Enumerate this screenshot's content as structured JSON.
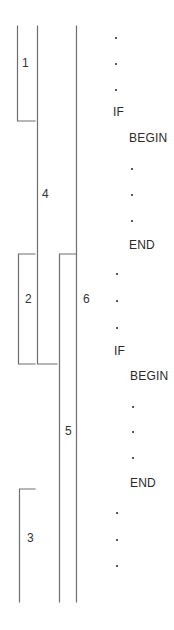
{
  "diagram": {
    "title": "",
    "segment_labels": [
      {
        "id": "1",
        "text": "1",
        "x": 22,
        "y": 57
      },
      {
        "id": "4",
        "text": "4",
        "x": 42,
        "y": 188
      },
      {
        "id": "2",
        "text": "2",
        "x": 25,
        "y": 293
      },
      {
        "id": "6",
        "text": "6",
        "x": 83,
        "y": 293
      },
      {
        "id": "5",
        "text": "5",
        "x": 65,
        "y": 425
      },
      {
        "id": "3",
        "text": "3",
        "x": 27,
        "y": 532
      }
    ],
    "code_lines": [
      {
        "type": "dot",
        "x": 115,
        "y": 37
      },
      {
        "type": "dot",
        "x": 115,
        "y": 63
      },
      {
        "type": "dot",
        "x": 115,
        "y": 89
      },
      {
        "type": "text",
        "text": "IF",
        "x": 113,
        "y": 106
      },
      {
        "type": "text",
        "text": "BEGIN",
        "x": 129,
        "y": 132
      },
      {
        "type": "dot",
        "x": 131,
        "y": 168
      },
      {
        "type": "dot",
        "x": 131,
        "y": 194
      },
      {
        "type": "dot",
        "x": 131,
        "y": 220
      },
      {
        "type": "text",
        "text": "END",
        "x": 129,
        "y": 239
      },
      {
        "type": "dot",
        "x": 116,
        "y": 273
      },
      {
        "type": "dot",
        "x": 116,
        "y": 300
      },
      {
        "type": "dot",
        "x": 116,
        "y": 327
      },
      {
        "type": "text",
        "text": "IF",
        "x": 114,
        "y": 345
      },
      {
        "type": "text",
        "text": "BEGIN",
        "x": 130,
        "y": 370
      },
      {
        "type": "dot",
        "x": 132,
        "y": 406
      },
      {
        "type": "dot",
        "x": 132,
        "y": 431
      },
      {
        "type": "dot",
        "x": 132,
        "y": 457
      },
      {
        "type": "text",
        "text": "END",
        "x": 130,
        "y": 477
      },
      {
        "type": "dot",
        "x": 116,
        "y": 512
      },
      {
        "type": "dot",
        "x": 116,
        "y": 539
      },
      {
        "type": "dot",
        "x": 116,
        "y": 565
      }
    ],
    "line_color": "#6e6e6e"
  }
}
